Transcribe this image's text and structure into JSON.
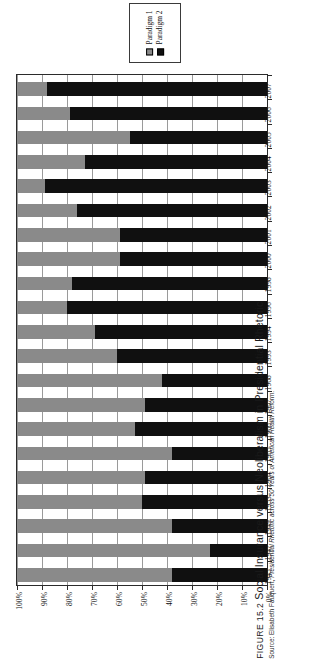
{
  "legend": {
    "entries": [
      {
        "label": "Paradigm 1",
        "color": "#8a8a8a",
        "icon": "legend-swatch-gray"
      },
      {
        "label": "Paradigm 2",
        "color": "#101010",
        "icon": "legend-swatch-black"
      }
    ]
  },
  "caption": {
    "figure_number": "FIGURE 15.2",
    "title": "Social Insurance versus Neoliberalism in Presidential Rhetoric",
    "source_prefix": "Source: Elisabeth Fauquert,",
    "source_italic": "Presidential Rhetoric across 50 Years of American Health Reform",
    "source_suffix": "."
  },
  "axes": {
    "value_axis_labels": [
      "100%",
      "90%",
      "80%",
      "70%",
      "60%",
      "50%",
      "40%",
      "30%",
      "20%",
      "10%",
      "0%"
    ],
    "value_axis_direction": "100% at left to 0% at right",
    "category_axis_labels": [
      "2007",
      "2006",
      "2005",
      "2004",
      "2003",
      "2002",
      "2001",
      "2000",
      "1998",
      "1996",
      "1994",
      "1993",
      "1968",
      "1967",
      "1966",
      "1965",
      "1964",
      "1953",
      "1949",
      "1947",
      "1945"
    ]
  },
  "chart_data": {
    "type": "bar",
    "orientation": "horizontal-stacked",
    "title": "Social Insurance versus Neoliberalism in Presidential Rhetoric",
    "xlabel": "",
    "ylabel": "",
    "xlim": [
      0,
      100
    ],
    "grid": true,
    "legend_position": "top-center",
    "note": "Stacked to 100%. Value axis is reversed: 100% at left edge, 0% at right edge. Paradigm 1 (gray) is drawn first from the left edge.",
    "categories": [
      "2007",
      "2006",
      "2005",
      "2004",
      "2003",
      "2002",
      "2001",
      "2000",
      "1998",
      "1996",
      "1994",
      "1993",
      "1968",
      "1967",
      "1966",
      "1965",
      "1964",
      "1953",
      "1949",
      "1947",
      "1945"
    ],
    "series": [
      {
        "name": "Paradigm 1",
        "color": "#8a8a8a",
        "values": [
          12,
          21,
          45,
          27,
          11,
          24,
          41,
          41,
          22,
          20,
          31,
          40,
          58,
          51,
          47,
          62,
          51,
          50,
          62,
          77,
          62
        ]
      },
      {
        "name": "Paradigm 2",
        "color": "#101010",
        "values": [
          88,
          79,
          55,
          73,
          89,
          76,
          59,
          59,
          78,
          80,
          69,
          60,
          42,
          49,
          53,
          38,
          49,
          50,
          38,
          23,
          38
        ]
      }
    ]
  }
}
